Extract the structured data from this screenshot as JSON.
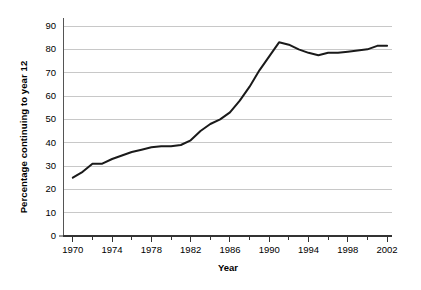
{
  "chart_data": {
    "type": "line",
    "title": "",
    "xlabel": "Year",
    "ylabel": "Percentage continuing to year 12",
    "xlim": [
      1969,
      2002.5
    ],
    "ylim": [
      0,
      95
    ],
    "grid": true,
    "legend_position": "none",
    "y_ticks": [
      0,
      10,
      20,
      30,
      40,
      50,
      60,
      70,
      80,
      90
    ],
    "y_tick_labels": [
      "0",
      "10",
      "20",
      "30",
      "40",
      "50",
      "60",
      "70",
      "80",
      "90"
    ],
    "x_ticks_major": [
      1970,
      1974,
      1978,
      1982,
      1986,
      1990,
      1994,
      1998,
      2002
    ],
    "x_tick_labels": [
      "1970",
      "1974",
      "1978",
      "1982",
      "1986",
      "1990",
      "1994",
      "1998",
      "2002"
    ],
    "x_ticks_minor": [
      1972,
      1976,
      1980,
      1984,
      1988,
      1992,
      1996,
      2000
    ],
    "series": [
      {
        "name": "Percentage continuing to year 12",
        "color": "#1a1a1a",
        "x": [
          1970,
          1971,
          1972,
          1973,
          1974,
          1975,
          1976,
          1977,
          1978,
          1979,
          1980,
          1981,
          1982,
          1983,
          1984,
          1985,
          1986,
          1987,
          1988,
          1989,
          1990,
          1991,
          1992,
          1993,
          1994,
          1995,
          1996,
          1997,
          1998,
          1999,
          2000,
          2001,
          2002
        ],
        "values": [
          25,
          27.5,
          31,
          31,
          33,
          34.5,
          36,
          37,
          38,
          38.5,
          38.5,
          39,
          41,
          45,
          48,
          50,
          53,
          58,
          64,
          71,
          77,
          83,
          82,
          80,
          78.5,
          77.5,
          78.5,
          78.5,
          79,
          79.5,
          80,
          81.5,
          81.5
        ]
      }
    ]
  },
  "axes": {
    "y_title": "Percentage continuing to year 12",
    "x_title": "Year"
  },
  "style": {
    "line_color": "#1a1a1a",
    "grid_color": "#c8c8c8",
    "axis_color": "#555555",
    "background": "#ffffff"
  }
}
